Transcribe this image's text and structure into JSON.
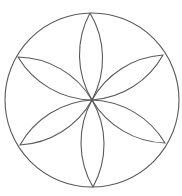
{
  "diagram": {
    "title": "",
    "type": "six-petal rosette inscribed in circle",
    "canvas": {
      "width": 182,
      "height": 196
    },
    "colors": {
      "background": "#ffffff",
      "stroke": "#5a5a5a"
    },
    "outer_circle": {
      "cx": 92,
      "cy": 100,
      "r": 87
    },
    "center_point": {
      "x": 92,
      "y": 100
    },
    "petal_arc_radius": 88,
    "petals": [
      {
        "name": "top",
        "tip": [
          90,
          13
        ]
      },
      {
        "name": "upper-right",
        "tip": [
          163,
          55
        ]
      },
      {
        "name": "lower-right",
        "tip": [
          165,
          143
        ]
      },
      {
        "name": "bottom",
        "tip": [
          93,
          187
        ]
      },
      {
        "name": "lower-left",
        "tip": [
          20,
          145
        ]
      },
      {
        "name": "upper-left",
        "tip": [
          18,
          57
        ]
      }
    ],
    "labels": []
  }
}
